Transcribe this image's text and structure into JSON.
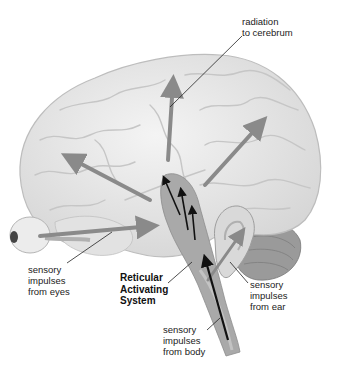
{
  "diagram": {
    "labels": {
      "radiation": "radiation\nto cerebrum",
      "eyes": "sensory\nimpulses\nfrom eyes",
      "ras": "Reticular\nActivating\nSystem",
      "ear": "sensory\nimpulses\nfrom ear",
      "body": "sensory\nimpulses\nfrom body"
    },
    "colors": {
      "brain_fill": "#e9e9e9",
      "brain_outline": "#bdbdbd",
      "gyri": "#c8c8c8",
      "arrow_gray": "#8a8a8a",
      "arrow_black": "#111111",
      "brainstem": "#a9a9a9",
      "cerebellum": "#9a9a9a"
    }
  }
}
